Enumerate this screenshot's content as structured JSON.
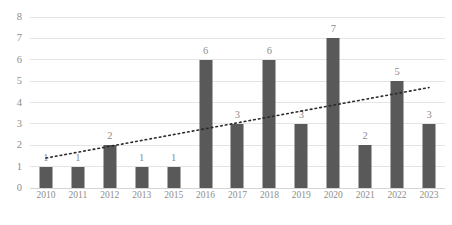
{
  "chart_data": {
    "type": "bar",
    "title": "",
    "subtitle": "",
    "xlabel": "",
    "ylabel": "",
    "categories": [
      "2010",
      "2011",
      "2012",
      "2013",
      "2015",
      "2016",
      "2017",
      "2018",
      "2019",
      "2020",
      "2021",
      "2022",
      "2023"
    ],
    "values": [
      1,
      1,
      2,
      1,
      1,
      6,
      3,
      6,
      3,
      7,
      2,
      5,
      3
    ],
    "data_labels": [
      "1",
      "1",
      "2",
      "1",
      "1",
      "6",
      "3",
      "6",
      "3",
      "7",
      "2",
      "5",
      "3"
    ],
    "ylim": [
      0,
      8
    ],
    "y_ticks": [
      "0",
      "1",
      "2",
      "3",
      "4",
      "5",
      "6",
      "7",
      "8"
    ],
    "y_tick_values": [
      0,
      1,
      2,
      3,
      4,
      5,
      6,
      7,
      8
    ],
    "grid": true,
    "grid_axis": "y",
    "legend": "none",
    "series": [
      {
        "name": "Publications",
        "type": "bar",
        "color": "#595959",
        "values": [
          1,
          1,
          2,
          1,
          1,
          6,
          3,
          6,
          3,
          7,
          2,
          5,
          3
        ]
      },
      {
        "name": "Linear trendline",
        "type": "line",
        "style": "dotted",
        "color": "#2b2b2b",
        "start_value": 1.4,
        "end_value": 4.7
      }
    ],
    "annotations": [],
    "colors": {
      "bar": "#595959",
      "trendline": "#2b2b2b",
      "gridline": "#e4e4e4",
      "axis_text": "#8d8d8d",
      "background": "#ffffff"
    }
  },
  "caption": {
    "text": ""
  }
}
